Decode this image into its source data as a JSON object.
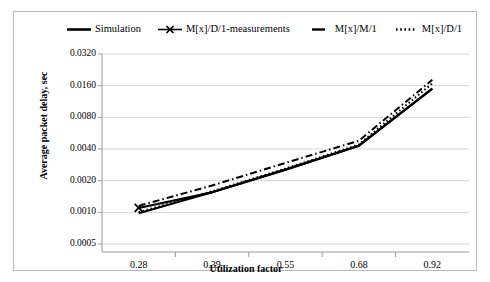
{
  "chart_data": {
    "type": "line",
    "title": "",
    "xlabel": "Utilization factor",
    "ylabel": "Average packet delay, sec",
    "categories": [
      "0.28",
      "0.39",
      "0.55",
      "0.68",
      "0.92"
    ],
    "yticks": [
      "0.0005",
      "0.0010",
      "0.0020",
      "0.0040",
      "0.0080",
      "0.0160",
      "0.0320"
    ],
    "ytick_values": [
      0.0005,
      0.001,
      0.002,
      0.004,
      0.008,
      0.016,
      0.032
    ],
    "yscale": "log2",
    "ylim": [
      0.0005,
      0.032
    ],
    "grid": "horizontal",
    "legend_position": "top",
    "series": [
      {
        "name": "Simulation",
        "style": "solid",
        "marker": "none",
        "color": "#000000",
        "values": [
          0.00098,
          0.00155,
          0.00255,
          0.0043,
          0.015
        ]
      },
      {
        "name": "M[x]/D/1-measurements",
        "style": "solid",
        "marker": "x",
        "color": "#000000",
        "values": [
          0.0011,
          0.00155,
          0.00255,
          0.0043,
          0.015
        ]
      },
      {
        "name": "M[x]/M/1",
        "style": "dash-dot",
        "marker": "none",
        "color": "#000000",
        "values": [
          0.00115,
          0.0018,
          0.00295,
          0.0048,
          0.0182
        ]
      },
      {
        "name": "M[x]/D/1",
        "style": "dotted",
        "marker": "none",
        "color": "#000000",
        "values": [
          0.001,
          0.00158,
          0.0026,
          0.0044,
          0.0168
        ]
      }
    ]
  },
  "legend": {
    "items": [
      {
        "label": "Simulation",
        "key": "solid-line"
      },
      {
        "label": "M[x]/D/1-measurements",
        "key": "solid-line-x-marker"
      },
      {
        "label": "M[x]/M/1",
        "key": "dash-line"
      },
      {
        "label": "M[x]/D/1",
        "key": "dotted-line"
      }
    ]
  },
  "axes": {
    "x_title": "Utilization factor",
    "y_title": "Average packet delay, sec"
  },
  "colors": {
    "series": "#000000",
    "grid": "#d4d4d4",
    "frame": "#b9b9b9",
    "background": "#ffffff"
  }
}
